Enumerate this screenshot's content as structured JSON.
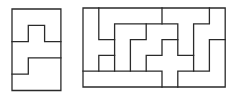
{
  "figures": [
    {
      "name": "small-polyomino-tiling",
      "grid_cols": 3,
      "grid_rows": 5,
      "origin": [
        12,
        9
      ],
      "cell": 16.3,
      "outer": [
        [
          0,
          0
        ],
        [
          3,
          0
        ],
        [
          3,
          5
        ],
        [
          0,
          5
        ],
        [
          0,
          0
        ]
      ],
      "edges": [
        [
          [
            0,
            2
          ],
          [
            1,
            2
          ],
          [
            1,
            1
          ],
          [
            2,
            1
          ],
          [
            2,
            2
          ],
          [
            3,
            2
          ]
        ],
        [
          [
            3,
            3
          ],
          [
            1,
            3
          ],
          [
            1,
            4
          ],
          [
            0,
            4
          ]
        ]
      ]
    },
    {
      "name": "large-polyomino-tiling",
      "grid_cols": 9,
      "grid_rows": 5,
      "origin": [
        83,
        8
      ],
      "cell": 15.8,
      "outer": [
        [
          0,
          0
        ],
        [
          9,
          0
        ],
        [
          9,
          5
        ],
        [
          0,
          5
        ],
        [
          0,
          0
        ]
      ],
      "edges": [
        [
          [
            1,
            0
          ],
          [
            1,
            2
          ],
          [
            2,
            2
          ]
        ],
        [
          [
            2,
            3
          ],
          [
            1,
            3
          ],
          [
            1,
            4
          ]
        ],
        [
          [
            2,
            4
          ],
          [
            2,
            1
          ],
          [
            6,
            1
          ],
          [
            6,
            3
          ],
          [
            7,
            3
          ]
        ],
        [
          [
            5,
            0
          ],
          [
            5,
            1
          ]
        ],
        [
          [
            4,
            1
          ],
          [
            4,
            2
          ],
          [
            3,
            2
          ],
          [
            3,
            4
          ]
        ],
        [
          [
            0,
            4
          ],
          [
            5,
            4
          ],
          [
            5,
            5
          ]
        ],
        [
          [
            6,
            2
          ],
          [
            5,
            2
          ],
          [
            5,
            3
          ],
          [
            4,
            3
          ],
          [
            4,
            4
          ]
        ],
        [
          [
            8,
            0
          ],
          [
            8,
            1
          ],
          [
            7,
            1
          ],
          [
            7,
            4
          ],
          [
            8,
            4
          ],
          [
            8,
            2
          ],
          [
            9,
            2
          ]
        ],
        [
          [
            6,
            5
          ],
          [
            6,
            4
          ],
          [
            7,
            4
          ]
        ]
      ]
    }
  ],
  "colors": {
    "stroke": "#2a2a2a",
    "background": "#ffffff"
  }
}
